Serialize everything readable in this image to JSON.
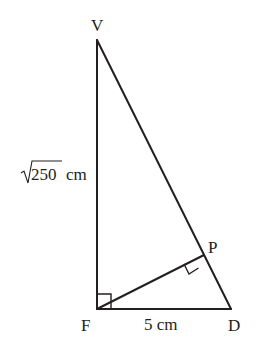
{
  "diagram": {
    "type": "right-triangle-geometry",
    "points": {
      "V": {
        "label": "V",
        "x": 97,
        "y": 40
      },
      "F": {
        "label": "F",
        "x": 97,
        "y": 309
      },
      "D": {
        "label": "D",
        "x": 231,
        "y": 309
      },
      "P": {
        "label": "P",
        "x": 204,
        "y": 255
      }
    },
    "segments": [
      {
        "from": "V",
        "to": "F"
      },
      {
        "from": "F",
        "to": "D"
      },
      {
        "from": "V",
        "to": "D"
      },
      {
        "from": "F",
        "to": "P"
      }
    ],
    "right_angles": [
      "F",
      "P"
    ],
    "measurements": {
      "VF": {
        "radicand": "250",
        "unit": "cm"
      },
      "FD": {
        "text": "5 cm"
      }
    },
    "colors": {
      "stroke": "#231f20",
      "background": "#ffffff"
    }
  }
}
